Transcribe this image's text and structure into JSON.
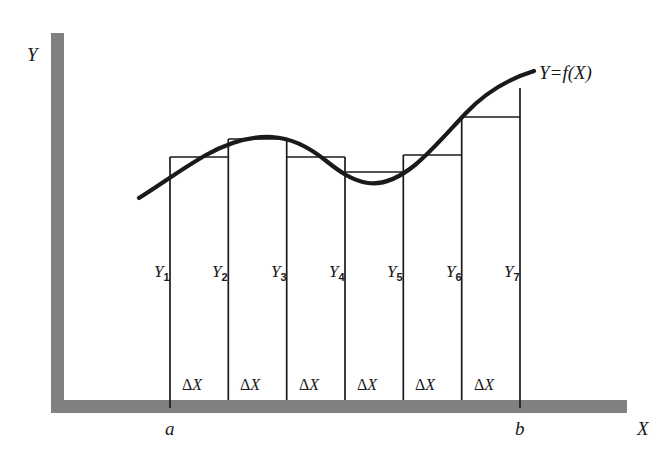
{
  "figure": {
    "title_label": "Y=f(X)",
    "axes": {
      "y_axis_label": "Y",
      "x_axis_label": "X",
      "axis_color": "#808080",
      "axis_thickness": 13,
      "y_axis_x": 51,
      "y_axis_top": 33,
      "x_axis_y": 400,
      "x_axis_right": 627
    },
    "curve": {
      "label": "Y=f(X)",
      "color": "#1a1a1a",
      "stroke_width": 4.2,
      "start": [
        139,
        198
      ],
      "end": [
        534,
        71
      ],
      "path": "M 139 198 C 160 185 183 168 206 155 C 229 142 252 136 272 137 C 292 138 310 148 325 160 C 340 172 353 181 368 183 C 383 185 399 178 415 165 C 431 152 448 132 466 113 C 484 94 508 79 534 71"
    },
    "ordinate_lines": {
      "count": 7,
      "x_positions": [
        170,
        228.3,
        286.7,
        345,
        403.3,
        461.7,
        520
      ],
      "top_y": [
        157,
        139,
        157,
        172,
        155,
        117,
        88
      ],
      "bottom_y": 408,
      "color": "#1a1a1a",
      "stroke_width": 1.6
    },
    "rectangles": {
      "note": "inscribed/circumscribed bars of the Riemann sum; tops drawn as thin horizontal rules between adjacent ordinates",
      "tops": [
        {
          "x1": 170,
          "x2": 228.3,
          "y": 157
        },
        {
          "x1": 228.3,
          "x2": 286.7,
          "y": 139
        },
        {
          "x1": 286.7,
          "x2": 345,
          "y": 157
        },
        {
          "x1": 345,
          "x2": 403.3,
          "y": 172
        },
        {
          "x1": 403.3,
          "x2": 461.7,
          "y": 155
        },
        {
          "x1": 461.7,
          "x2": 520,
          "y": 117
        }
      ],
      "color": "#1a1a1a",
      "stroke_width": 1.3
    },
    "ordinate_labels": [
      {
        "text": "Y",
        "sub": "1",
        "x": 154,
        "y": 272
      },
      {
        "text": "Y",
        "sub": "2",
        "x": 212,
        "y": 272
      },
      {
        "text": "Y",
        "sub": "3",
        "x": 271,
        "y": 272
      },
      {
        "text": "Y",
        "sub": "4",
        "x": 329,
        "y": 272
      },
      {
        "text": "Y",
        "sub": "5",
        "x": 387,
        "y": 272
      },
      {
        "text": "Y",
        "sub": "6",
        "x": 446,
        "y": 272
      },
      {
        "text": "Y",
        "sub": "7",
        "x": 504,
        "y": 272
      }
    ],
    "width_labels": [
      {
        "symbol": "Δ",
        "var": "X",
        "x": 199,
        "y": 385
      },
      {
        "symbol": "Δ",
        "var": "X",
        "x": 257,
        "y": 385
      },
      {
        "symbol": "Δ",
        "var": "X",
        "x": 316,
        "y": 385
      },
      {
        "symbol": "Δ",
        "var": "X",
        "x": 374,
        "y": 385
      },
      {
        "symbol": "Δ",
        "var": "X",
        "x": 432,
        "y": 385
      },
      {
        "symbol": "Δ",
        "var": "X",
        "x": 491,
        "y": 385
      }
    ],
    "bounds": [
      {
        "label": "a",
        "x": 170,
        "y": 428
      },
      {
        "label": "b",
        "x": 520,
        "y": 428
      }
    ]
  }
}
